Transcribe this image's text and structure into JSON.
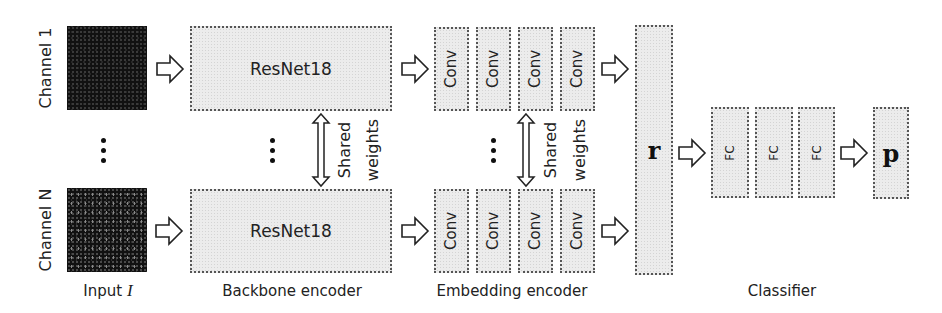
{
  "diagram": {
    "type": "neural-network-architecture",
    "input": {
      "channels": [
        {
          "label": "Channel 1"
        },
        {
          "label": "Channel N"
        }
      ],
      "ellipsis": "⋮",
      "caption_text": "Input",
      "caption_symbol": "I"
    },
    "backbone": {
      "blocks": [
        {
          "label": "ResNet18"
        },
        {
          "label": "ResNet18"
        }
      ],
      "shared_label_line1": "Shared",
      "shared_label_line2": "weights",
      "caption": "Backbone encoder"
    },
    "embedding": {
      "top_row": [
        {
          "label": "Conv"
        },
        {
          "label": "Conv"
        },
        {
          "label": "Conv"
        },
        {
          "label": "Conv"
        }
      ],
      "bottom_row": [
        {
          "label": "Conv"
        },
        {
          "label": "Conv"
        },
        {
          "label": "Conv"
        },
        {
          "label": "Conv"
        }
      ],
      "shared_label_line1": "Shared",
      "shared_label_line2": "weights",
      "caption": "Embedding encoder"
    },
    "representation": {
      "label": "r"
    },
    "classifier": {
      "layers": [
        {
          "label": "FC"
        },
        {
          "label": "FC"
        },
        {
          "label": "FC"
        }
      ],
      "output": {
        "label": "p"
      },
      "caption": "Classifier"
    },
    "arrows": {
      "style": "hollow-block-arrow",
      "count_forward": 7,
      "count_bidirectional": 2
    }
  }
}
